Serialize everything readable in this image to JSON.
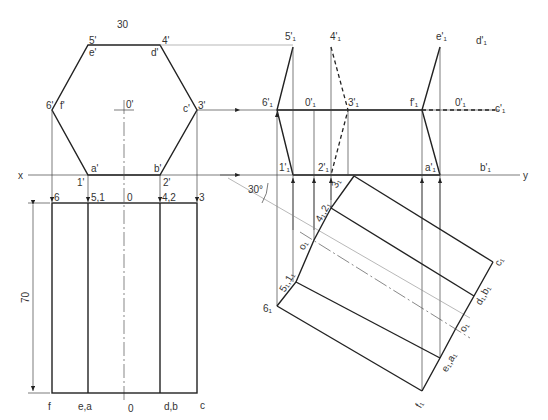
{
  "drawing": {
    "dimension_top": "30",
    "dimension_height": "70",
    "angle": "30°",
    "axis_x": "x",
    "axis_y": "y"
  },
  "front_view": {
    "vertices_upper": [
      "5'",
      "4'",
      "3'",
      "2'",
      "1'",
      "6'"
    ],
    "vertices_lower": [
      "e'",
      "d'",
      "c'",
      "b'",
      "a'",
      "f'"
    ],
    "center": "0'"
  },
  "top_view": {
    "top_labels": [
      "6",
      "5,1",
      "0",
      "4,2",
      "3"
    ],
    "bottom_labels": [
      "f",
      "e,a",
      "0",
      "d,b",
      "c"
    ]
  },
  "aux_front": {
    "labels": [
      "5'₁",
      "4'₁",
      "6'₁",
      "0'₁",
      "3'₁",
      "1'₁",
      "2'₁",
      "e'₁",
      "d'₁",
      "f'₁",
      "0'₁",
      "c'₁",
      "a'₁",
      "b'₁"
    ]
  },
  "aux_top": {
    "labels": [
      "3₁",
      "4₁,2₁",
      "o₁",
      "5₁,1₁",
      "6₁",
      "c₁",
      "d₁,b₁",
      "o₁",
      "e₁,a₁",
      "f₁"
    ]
  }
}
